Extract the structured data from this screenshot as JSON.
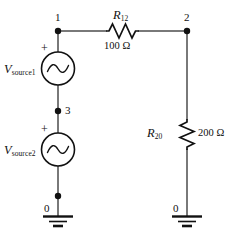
{
  "figure": {
    "kind": "circuit-schematic",
    "background_color": "#ffffff",
    "line_color": "#4d4d4d",
    "symbol_color": "#111111"
  },
  "nodes": [
    {
      "id": "node-1",
      "label": "1"
    },
    {
      "id": "node-2",
      "label": "2"
    },
    {
      "id": "node-3",
      "label": "3"
    },
    {
      "id": "ground-left",
      "label": "0"
    },
    {
      "id": "ground-right",
      "label": "0"
    }
  ],
  "sources": [
    {
      "id": "vsource1",
      "name": "V",
      "subscript": "source1",
      "polarity": "+",
      "symbol": "ac-sine-source-icon"
    },
    {
      "id": "vsource2",
      "name": "V",
      "subscript": "source2",
      "polarity": "+",
      "symbol": "ac-sine-source-icon"
    }
  ],
  "resistors": [
    {
      "id": "r12",
      "name": "R",
      "subscript": "12",
      "value": "100 Ω",
      "orientation": "horizontal",
      "symbol": "resistor-zigzag-icon"
    },
    {
      "id": "r20",
      "name": "R",
      "subscript": "20",
      "value": "200 Ω",
      "orientation": "vertical",
      "symbol": "resistor-zigzag-icon"
    }
  ]
}
